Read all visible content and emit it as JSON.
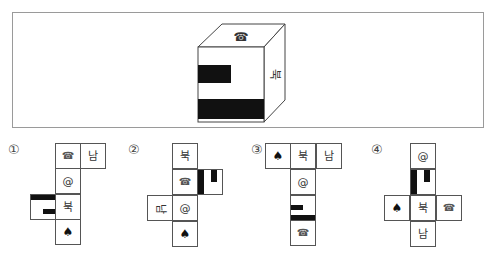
{
  "question": {
    "cube": {
      "top_face": {
        "icon": "telephone-icon",
        "glyph": "☎"
      },
      "right_face": {
        "text": "북",
        "rotation": "90deg"
      },
      "front_face": {
        "pattern": "two-black-bars",
        "fill": "#111111"
      }
    }
  },
  "options": [
    {
      "label": "①",
      "cells": [
        {
          "text": "☎",
          "kind": "telephone"
        },
        {
          "text": "남",
          "kind": "text"
        },
        {
          "text": "@",
          "kind": "text"
        },
        {
          "text": "",
          "kind": "black-pattern"
        },
        {
          "text": "북",
          "kind": "text"
        },
        {
          "text": "♠",
          "kind": "spade"
        }
      ]
    },
    {
      "label": "②",
      "cells": [
        {
          "text": "북",
          "kind": "text"
        },
        {
          "text": "☎",
          "kind": "telephone"
        },
        {
          "text": "",
          "kind": "black-pattern"
        },
        {
          "text": "남",
          "kind": "text-rotated"
        },
        {
          "text": "@",
          "kind": "text"
        },
        {
          "text": "♠",
          "kind": "spade"
        }
      ]
    },
    {
      "label": "③",
      "cells": [
        {
          "text": "♠",
          "kind": "spade"
        },
        {
          "text": "북",
          "kind": "text"
        },
        {
          "text": "남",
          "kind": "text"
        },
        {
          "text": "@",
          "kind": "text"
        },
        {
          "text": "",
          "kind": "black-pattern"
        },
        {
          "text": "☎",
          "kind": "telephone"
        }
      ]
    },
    {
      "label": "④",
      "cells": [
        {
          "text": "@",
          "kind": "text"
        },
        {
          "text": "",
          "kind": "black-pattern"
        },
        {
          "text": "♠",
          "kind": "spade"
        },
        {
          "text": "북",
          "kind": "text"
        },
        {
          "text": "☎",
          "kind": "telephone"
        },
        {
          "text": "남",
          "kind": "text"
        }
      ]
    }
  ],
  "colors": {
    "border": "#555555",
    "fill": "#111111",
    "frame": "#9a9a9a"
  }
}
